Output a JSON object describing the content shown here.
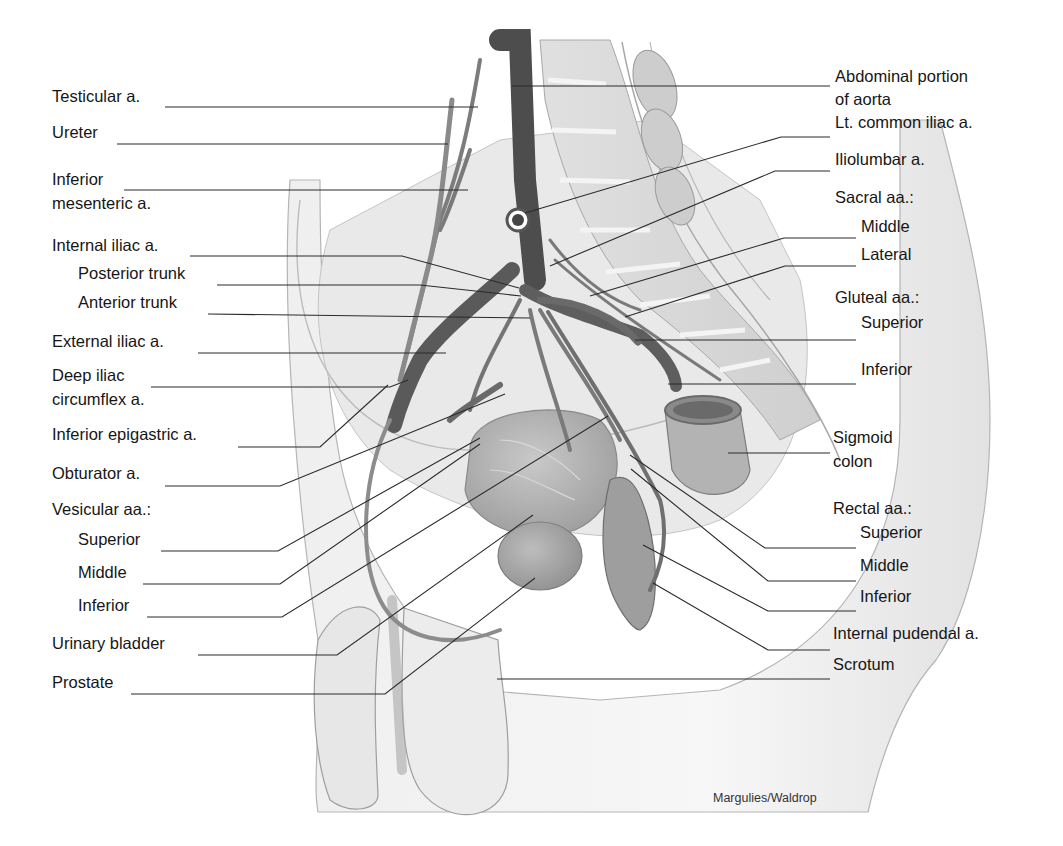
{
  "diagram": {
    "credit": "Margulies/Waldrop",
    "colors": {
      "background": "#ffffff",
      "artery": "#6e6e6e",
      "artery_dark": "#4a4a4a",
      "tissue": "#d9d9d9",
      "tissue_light": "#ececec",
      "leader_line": "#2a2a2a",
      "text": "#161616"
    }
  },
  "labels_left": [
    {
      "id": "testicular",
      "text": "Testicular a.",
      "x": 52,
      "y": 96
    },
    {
      "id": "ureter",
      "text": "Ureter",
      "x": 52,
      "y": 132
    },
    {
      "id": "inferior-mesenteric-1",
      "text": "Inferior",
      "x": 52,
      "y": 179
    },
    {
      "id": "inferior-mesenteric-2",
      "text": "mesenteric a.",
      "x": 52,
      "y": 203
    },
    {
      "id": "internal-iliac",
      "text": "Internal iliac a.",
      "x": 52,
      "y": 245
    },
    {
      "id": "posterior-trunk",
      "text": "Posterior trunk",
      "x": 78,
      "y": 273
    },
    {
      "id": "anterior-trunk",
      "text": "Anterior trunk",
      "x": 78,
      "y": 302
    },
    {
      "id": "external-iliac",
      "text": "External iliac a.",
      "x": 52,
      "y": 341
    },
    {
      "id": "deep-iliac-1",
      "text": "Deep iliac",
      "x": 52,
      "y": 375
    },
    {
      "id": "deep-iliac-2",
      "text": "circumflex a.",
      "x": 52,
      "y": 399
    },
    {
      "id": "inferior-epigastric",
      "text": "Inferior epigastric a.",
      "x": 52,
      "y": 434
    },
    {
      "id": "obturator",
      "text": "Obturator a.",
      "x": 52,
      "y": 473
    },
    {
      "id": "vesicular-header",
      "text": "Vesicular aa.:",
      "x": 52,
      "y": 509
    },
    {
      "id": "vesicular-superior",
      "text": "Superior",
      "x": 78,
      "y": 539
    },
    {
      "id": "vesicular-middle",
      "text": "Middle",
      "x": 78,
      "y": 572
    },
    {
      "id": "vesicular-inferior",
      "text": "Inferior",
      "x": 78,
      "y": 605
    },
    {
      "id": "urinary-bladder",
      "text": "Urinary bladder",
      "x": 52,
      "y": 643
    },
    {
      "id": "prostate",
      "text": "Prostate",
      "x": 52,
      "y": 682
    }
  ],
  "labels_right": [
    {
      "id": "aorta-1",
      "text": "Abdominal portion",
      "x": 835,
      "y": 76
    },
    {
      "id": "aorta-2",
      "text": "of aorta",
      "x": 835,
      "y": 99
    },
    {
      "id": "lt-common-iliac",
      "text": "Lt. common iliac a.",
      "x": 835,
      "y": 122
    },
    {
      "id": "iliolumbar",
      "text": "Iliolumbar a.",
      "x": 835,
      "y": 159
    },
    {
      "id": "sacral-header",
      "text": "Sacral aa.:",
      "x": 835,
      "y": 197
    },
    {
      "id": "sacral-middle",
      "text": "Middle",
      "x": 861,
      "y": 226
    },
    {
      "id": "sacral-lateral",
      "text": "Lateral",
      "x": 861,
      "y": 254
    },
    {
      "id": "gluteal-header",
      "text": "Gluteal aa.:",
      "x": 835,
      "y": 297
    },
    {
      "id": "gluteal-superior",
      "text": "Superior",
      "x": 861,
      "y": 322
    },
    {
      "id": "gluteal-inferior",
      "text": "Inferior",
      "x": 861,
      "y": 369
    },
    {
      "id": "sigmoid-1",
      "text": "Sigmoid",
      "x": 833,
      "y": 437
    },
    {
      "id": "sigmoid-2",
      "text": "colon",
      "x": 833,
      "y": 461
    },
    {
      "id": "rectal-header",
      "text": "Rectal aa.:",
      "x": 833,
      "y": 508
    },
    {
      "id": "rectal-superior",
      "text": "Superior",
      "x": 860,
      "y": 532
    },
    {
      "id": "rectal-middle",
      "text": "Middle",
      "x": 860,
      "y": 565
    },
    {
      "id": "rectal-inferior",
      "text": "Inferior",
      "x": 860,
      "y": 596
    },
    {
      "id": "internal-pudendal",
      "text": "Internal pudendal a.",
      "x": 833,
      "y": 633
    },
    {
      "id": "scrotum",
      "text": "Scrotum",
      "x": 833,
      "y": 664
    }
  ],
  "leaders": [
    {
      "id": "testicular",
      "points": "165,107 478,107"
    },
    {
      "id": "ureter",
      "points": "117,144 448,144"
    },
    {
      "id": "inferior-mesenteric",
      "points": "124,190 468,190"
    },
    {
      "id": "internal-iliac",
      "points": "190,256 402,256 519,288"
    },
    {
      "id": "posterior-trunk",
      "points": "217,285 420,285 521,296"
    },
    {
      "id": "anterior-trunk",
      "points": "208,314 530,318"
    },
    {
      "id": "external-iliac",
      "points": "198,353 446,353"
    },
    {
      "id": "deep-iliac",
      "points": "151,387 390,387 408,380"
    },
    {
      "id": "inferior-epigastric",
      "points": "238,447 320,447 388,385"
    },
    {
      "id": "obturator",
      "points": "165,486 280,486 505,394"
    },
    {
      "id": "vesicular-superior",
      "points": "161,551 278,551 480,438"
    },
    {
      "id": "vesicular-middle",
      "points": "143,584 280,584 480,444"
    },
    {
      "id": "vesicular-inferior",
      "points": "147,617 282,617 608,416"
    },
    {
      "id": "urinary-bladder",
      "points": "198,655 337,655 533,515"
    },
    {
      "id": "prostate",
      "points": "131,694 385,694 535,578"
    },
    {
      "id": "aorta",
      "points": "512,86 830,86"
    },
    {
      "id": "lt-common-iliac",
      "points": "525,213 781,137 830,137"
    },
    {
      "id": "iliolumbar",
      "points": "550,266 775,171 830,171"
    },
    {
      "id": "sacral-middle",
      "points": "590,296 784,238 856,238"
    },
    {
      "id": "sacral-lateral",
      "points": "625,317 785,266 856,266"
    },
    {
      "id": "gluteal-superior",
      "points": "635,340 856,340"
    },
    {
      "id": "gluteal-inferior",
      "points": "668,384 856,384"
    },
    {
      "id": "sigmoid",
      "points": "728,453 830,453"
    },
    {
      "id": "rectal-superior",
      "points": "630,455 765,548 856,548"
    },
    {
      "id": "rectal-middle",
      "points": "631,469 768,581 856,581"
    },
    {
      "id": "rectal-inferior",
      "points": "643,545 768,611 856,611"
    },
    {
      "id": "internal-pudendal",
      "points": "653,583 768,650 830,650"
    },
    {
      "id": "scrotum",
      "points": "497,679 830,679"
    }
  ]
}
